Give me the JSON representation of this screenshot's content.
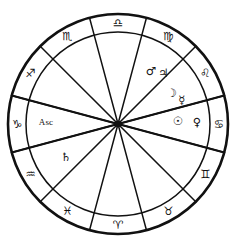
{
  "chart_data": {
    "type": "pie",
    "subtitle": "",
    "xlabel": "",
    "ylabel": "",
    "legend_position": "none",
    "grid": false,
    "geometry": {
      "center_x": 118,
      "center_y": 124,
      "outer_radius": 110,
      "inner_ring_radius": 92,
      "sector_count": 12,
      "sector_span_degrees": 30
    },
    "categories": [
      "Libra",
      "Virgo",
      "Leo",
      "Cancer",
      "Gemini",
      "Taurus",
      "Aries",
      "Pisces",
      "Aquarius",
      "Capricorn",
      "Sagittarius",
      "Scorpio"
    ],
    "values": [
      30,
      30,
      30,
      30,
      30,
      30,
      30,
      30,
      30,
      30,
      30,
      30
    ]
  },
  "wheel": {
    "center_marker": "center-point",
    "signs": [
      {
        "name": "Libra",
        "glyph": "♎",
        "angle_deg": 90,
        "label_radius": 101
      },
      {
        "name": "Virgo",
        "glyph": "♍",
        "angle_deg": 60,
        "label_radius": 101
      },
      {
        "name": "Leo",
        "glyph": "♌",
        "angle_deg": 30,
        "label_radius": 101
      },
      {
        "name": "Cancer",
        "glyph": "♋",
        "angle_deg": 0,
        "label_radius": 101
      },
      {
        "name": "Gemini",
        "glyph": "♊",
        "angle_deg": -30,
        "label_radius": 101
      },
      {
        "name": "Taurus",
        "glyph": "♉",
        "angle_deg": -60,
        "label_radius": 101
      },
      {
        "name": "Aries",
        "glyph": "♈",
        "angle_deg": -90,
        "label_radius": 101
      },
      {
        "name": "Pisces",
        "glyph": "♓",
        "angle_deg": -120,
        "label_radius": 101
      },
      {
        "name": "Aquarius",
        "glyph": "♒",
        "angle_deg": -150,
        "label_radius": 101
      },
      {
        "name": "Capricorn",
        "glyph": "♑",
        "angle_deg": 180,
        "label_radius": 101
      },
      {
        "name": "Sagittarius",
        "glyph": "♐",
        "angle_deg": 150,
        "label_radius": 101
      },
      {
        "name": "Scorpio",
        "glyph": "♏",
        "angle_deg": 120,
        "label_radius": 101
      }
    ],
    "planets": [
      {
        "name": "Mars",
        "glyph": "♂",
        "angle_deg": 58,
        "radius": 62
      },
      {
        "name": "Jupiter",
        "glyph": "♃",
        "angle_deg": 48,
        "radius": 68
      },
      {
        "name": "Moon",
        "glyph": "☽",
        "angle_deg": 30,
        "radius": 62
      },
      {
        "name": "Mercury",
        "glyph": "☿",
        "angle_deg": 20,
        "radius": 68
      },
      {
        "name": "Sun",
        "glyph": "☉",
        "angle_deg": 2,
        "radius": 60
      },
      {
        "name": "Venus",
        "glyph": "♀",
        "angle_deg": 1,
        "radius": 79
      },
      {
        "name": "Saturn",
        "glyph": "♄",
        "angle_deg": -147,
        "radius": 62
      }
    ],
    "points": [
      {
        "name": "Ascendant",
        "label": "Asc",
        "angle_deg": 179,
        "radius": 72
      }
    ]
  }
}
